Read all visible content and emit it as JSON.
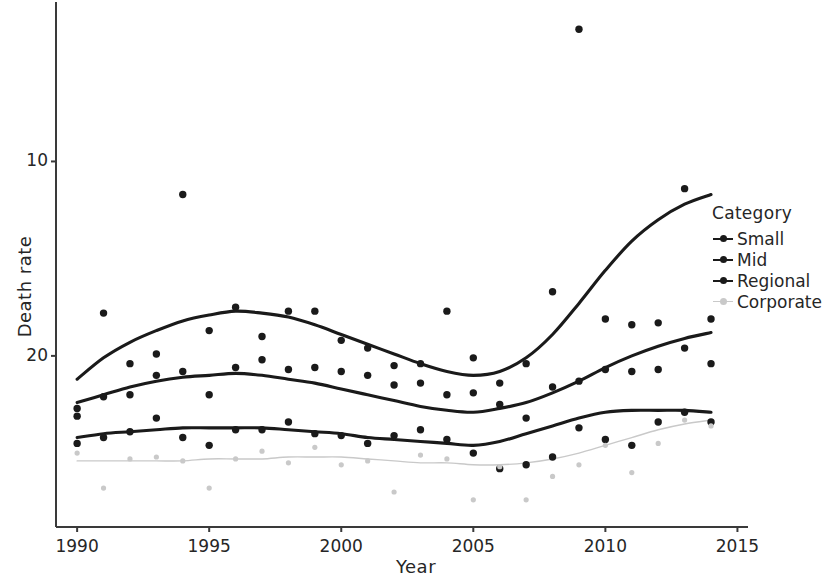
{
  "chart_data": {
    "type": "scatter",
    "title": "",
    "xlabel": "Year",
    "ylabel": "Death rate",
    "xlim": [
      1989.2,
      2015.4
    ],
    "ylim": [
      1.2,
      28.2
    ],
    "xticks": [
      1990,
      1995,
      2000,
      2005,
      2010,
      2015
    ],
    "yticks": [
      10,
      20
    ],
    "grid": false,
    "legend_title": "Category",
    "legend_position": "right",
    "smoother": "loess",
    "series": [
      {
        "name": "Small",
        "color": "#1a1a1a",
        "x": [
          1990,
          1991,
          1992,
          1993,
          1994,
          1995,
          1996,
          1997,
          1998,
          1999,
          2000,
          2001,
          2002,
          2003,
          2004,
          2005,
          2006,
          2007,
          2008,
          2009,
          2010,
          2011,
          2012,
          2013,
          2014
        ],
        "y": [
          7.3,
          12.2,
          9.6,
          10.1,
          18.3,
          11.3,
          12.5,
          11.0,
          12.3,
          12.3,
          10.8,
          10.4,
          9.5,
          9.6,
          12.3,
          9.9,
          7.5,
          9.6,
          13.3,
          26.8,
          11.9,
          11.6,
          11.7,
          18.6,
          11.9
        ],
        "trend": [
          [
            1990,
            8.8
          ],
          [
            1991,
            9.9
          ],
          [
            1992,
            10.7
          ],
          [
            1993,
            11.3
          ],
          [
            1994,
            11.8
          ],
          [
            1995,
            12.1
          ],
          [
            1996,
            12.3
          ],
          [
            1997,
            12.2
          ],
          [
            1998,
            12.0
          ],
          [
            1999,
            11.6
          ],
          [
            2000,
            11.1
          ],
          [
            2001,
            10.6
          ],
          [
            2002,
            10.1
          ],
          [
            2003,
            9.6
          ],
          [
            2004,
            9.2
          ],
          [
            2005,
            9.0
          ],
          [
            2006,
            9.2
          ],
          [
            2007,
            9.9
          ],
          [
            2008,
            11.1
          ],
          [
            2009,
            12.7
          ],
          [
            2010,
            14.4
          ],
          [
            2011,
            15.9
          ],
          [
            2012,
            17.0
          ],
          [
            2013,
            17.8
          ],
          [
            2014,
            18.3
          ]
        ]
      },
      {
        "name": "Mid",
        "color": "#1a1a1a",
        "x": [
          1990,
          1991,
          1992,
          1993,
          1994,
          1995,
          1996,
          1997,
          1998,
          1999,
          2000,
          2001,
          2002,
          2003,
          2004,
          2005,
          2006,
          2007,
          2008,
          2009,
          2010,
          2011,
          2012,
          2013,
          2014
        ],
        "y": [
          6.9,
          7.9,
          8.0,
          9.0,
          9.2,
          8.0,
          9.4,
          9.8,
          9.3,
          9.4,
          9.2,
          9.0,
          8.5,
          8.6,
          8.0,
          8.1,
          8.6,
          6.8,
          8.4,
          8.7,
          9.3,
          9.2,
          9.3,
          10.4,
          9.6
        ],
        "trend": [
          [
            1990,
            7.6
          ],
          [
            1991,
            8.0
          ],
          [
            1992,
            8.4
          ],
          [
            1993,
            8.7
          ],
          [
            1994,
            8.9
          ],
          [
            1995,
            9.0
          ],
          [
            1996,
            9.1
          ],
          [
            1997,
            9.0
          ],
          [
            1998,
            8.8
          ],
          [
            1999,
            8.6
          ],
          [
            2000,
            8.3
          ],
          [
            2001,
            8.0
          ],
          [
            2002,
            7.7
          ],
          [
            2003,
            7.4
          ],
          [
            2004,
            7.2
          ],
          [
            2005,
            7.1
          ],
          [
            2006,
            7.3
          ],
          [
            2007,
            7.6
          ],
          [
            2008,
            8.1
          ],
          [
            2009,
            8.7
          ],
          [
            2010,
            9.4
          ],
          [
            2011,
            10.0
          ],
          [
            2012,
            10.5
          ],
          [
            2013,
            10.9
          ],
          [
            2014,
            11.2
          ]
        ]
      },
      {
        "name": "Regional",
        "color": "#1a1a1a",
        "x": [
          1990,
          1991,
          1992,
          1993,
          1994,
          1995,
          1996,
          1997,
          1998,
          1999,
          2000,
          2001,
          2002,
          2003,
          2004,
          2005,
          2006,
          2007,
          2008,
          2009,
          2010,
          2011,
          2012,
          2013,
          2014
        ],
        "y": [
          5.5,
          5.8,
          6.1,
          6.8,
          5.8,
          5.4,
          6.2,
          6.2,
          6.6,
          6.0,
          5.9,
          5.5,
          5.9,
          6.2,
          5.7,
          5.0,
          4.2,
          4.4,
          4.8,
          6.3,
          5.7,
          5.4,
          6.6,
          7.1,
          6.6
        ],
        "trend": [
          [
            1990,
            5.8
          ],
          [
            1991,
            6.0
          ],
          [
            1992,
            6.1
          ],
          [
            1993,
            6.2
          ],
          [
            1994,
            6.3
          ],
          [
            1995,
            6.3
          ],
          [
            1996,
            6.3
          ],
          [
            1997,
            6.3
          ],
          [
            1998,
            6.2
          ],
          [
            1999,
            6.1
          ],
          [
            2000,
            6.0
          ],
          [
            2001,
            5.8
          ],
          [
            2002,
            5.7
          ],
          [
            2003,
            5.6
          ],
          [
            2004,
            5.5
          ],
          [
            2005,
            5.4
          ],
          [
            2006,
            5.6
          ],
          [
            2007,
            6.0
          ],
          [
            2008,
            6.4
          ],
          [
            2009,
            6.8
          ],
          [
            2010,
            7.1
          ],
          [
            2011,
            7.2
          ],
          [
            2012,
            7.2
          ],
          [
            2013,
            7.2
          ],
          [
            2014,
            7.1
          ]
        ]
      },
      {
        "name": "Corporate",
        "color": "#c9c9c9",
        "x": [
          1990,
          1991,
          1992,
          1993,
          1994,
          1995,
          1996,
          1997,
          1998,
          1999,
          2000,
          2001,
          2002,
          2003,
          2004,
          2005,
          2006,
          2007,
          2008,
          2009,
          2010,
          2011,
          2012,
          2013,
          2014
        ],
        "y": [
          5.0,
          3.2,
          4.7,
          4.8,
          4.6,
          3.2,
          4.7,
          5.1,
          4.5,
          5.3,
          4.4,
          4.6,
          3.0,
          4.9,
          4.7,
          2.6,
          4.3,
          2.6,
          3.8,
          4.4,
          5.4,
          4.0,
          5.5,
          6.7,
          6.4
        ],
        "trend": [
          [
            1990,
            4.6
          ],
          [
            1991,
            4.6
          ],
          [
            1992,
            4.6
          ],
          [
            1993,
            4.6
          ],
          [
            1994,
            4.6
          ],
          [
            1995,
            4.7
          ],
          [
            1996,
            4.7
          ],
          [
            1997,
            4.7
          ],
          [
            1998,
            4.8
          ],
          [
            1999,
            4.8
          ],
          [
            2000,
            4.8
          ],
          [
            2001,
            4.7
          ],
          [
            2002,
            4.6
          ],
          [
            2003,
            4.5
          ],
          [
            2004,
            4.5
          ],
          [
            2005,
            4.4
          ],
          [
            2006,
            4.4
          ],
          [
            2007,
            4.5
          ],
          [
            2008,
            4.7
          ],
          [
            2009,
            5.0
          ],
          [
            2010,
            5.4
          ],
          [
            2011,
            5.8
          ],
          [
            2012,
            6.2
          ],
          [
            2013,
            6.5
          ],
          [
            2014,
            6.7
          ]
        ]
      }
    ]
  },
  "axes": {
    "x_title": "Year",
    "y_title": "Death rate",
    "x_tick_labels": [
      "1990",
      "1995",
      "2000",
      "2005",
      "2010",
      "2015"
    ],
    "y_tick_labels": [
      "20",
      "10"
    ]
  },
  "legend": {
    "title": "Category",
    "items": [
      {
        "label": "Small",
        "color": "#1a1a1a"
      },
      {
        "label": "Mid",
        "color": "#1a1a1a"
      },
      {
        "label": "Regional",
        "color": "#1a1a1a"
      },
      {
        "label": "Corporate",
        "color": "#c9c9c9"
      }
    ]
  }
}
